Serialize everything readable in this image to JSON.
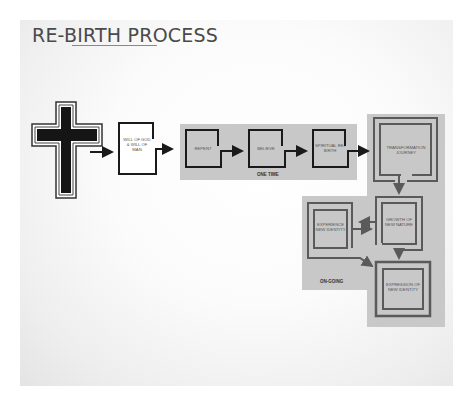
{
  "title": "RE-BIRTH PROCESS",
  "nodes": {
    "cross": {
      "icon": "cross-icon"
    },
    "will": {
      "label": "WILL OF GOD & WILL OF MAN"
    },
    "repent": {
      "label": "REPENT"
    },
    "believe": {
      "label": "BELIEVE"
    },
    "spiritual": {
      "label": "SPIRITUAL RE-BIRTH"
    },
    "transformation": {
      "label": "TRANSFORMATION JOURNEY"
    },
    "growth": {
      "label": "GROWTH OF NEW NATURE"
    },
    "experience": {
      "label": "EXPERIENCE NEW IDENTITY"
    },
    "expression": {
      "label": "EXPRESSION OF NEW IDENTITY"
    }
  },
  "groups": {
    "one_time": "ONE TIME",
    "on_going": "ON-GOING"
  },
  "colors": {
    "band": "#c8c8c8",
    "stroke": "#1a1a1a",
    "stroke_gray": "#5a5a5a",
    "text": "#555555"
  }
}
